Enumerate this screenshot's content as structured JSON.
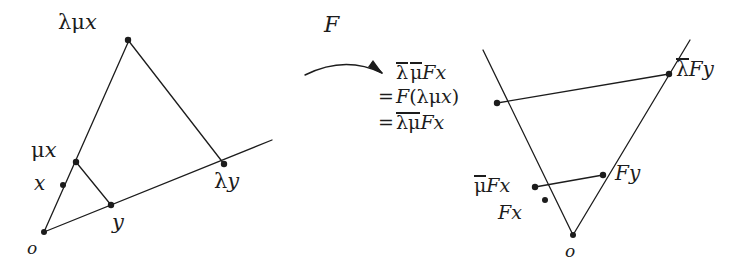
{
  "figure": {
    "background_color": "#ffffff",
    "ink_color": "#1c1c1c",
    "stroke_width": 1.3,
    "dot_radius": 3.0
  },
  "map_arrow": {
    "label": "F",
    "direction": "left-to-right",
    "shape": "curved-arc-with-arrowhead"
  },
  "left_figure": {
    "name": "source-triangle",
    "labels": {
      "apex": "λμx",
      "mid_left": "μx",
      "lower_left": "x",
      "origin": "o",
      "base_mid": "y",
      "base_right": "λy"
    },
    "points": [
      {
        "name": "o",
        "label": "o",
        "x": 44,
        "y": 232
      },
      {
        "name": "x",
        "label": "x",
        "x": 63,
        "y": 185
      },
      {
        "name": "mux",
        "label": "μx",
        "x": 76,
        "y": 162
      },
      {
        "name": "lmux",
        "label": "λμx",
        "x": 128,
        "y": 40
      },
      {
        "name": "y",
        "label": "y",
        "x": 111,
        "y": 205
      },
      {
        "name": "ly",
        "label": "λy",
        "x": 224,
        "y": 164
      }
    ],
    "segments": [
      {
        "from": "o",
        "to": "lmux",
        "note": "ray through x and mux to apex"
      },
      {
        "from": "o",
        "to": "ly",
        "note": "base ray through y, extended past ly"
      },
      {
        "from": "lmux",
        "to": "ly",
        "note": "outer side"
      },
      {
        "from": "mux",
        "to": "y",
        "note": "inner side"
      }
    ]
  },
  "right_figure": {
    "name": "image-triangle",
    "labels": {
      "apex_left_line1": "λ̄ μ̄Fx",
      "apex_left_line2": "= F(λμx)",
      "apex_left_line3": "= λμ̄Fx",
      "apex_right": "λ̄Fy",
      "mid_left": "μ̄Fx",
      "lower_left": "Fx",
      "mid_right": "Fy",
      "origin": "o"
    },
    "stack": [
      {
        "eq": "",
        "text": "λ̄ μ̄Fx"
      },
      {
        "eq": "=",
        "text": "F(λμx)"
      },
      {
        "eq": "=",
        "text": "λμ̄Fx"
      }
    ],
    "points": [
      {
        "name": "o",
        "label": "o",
        "x": 573,
        "y": 235
      },
      {
        "name": "Fx",
        "label": "Fx",
        "x": 545,
        "y": 200
      },
      {
        "name": "muFx",
        "label": "μ̄Fx",
        "x": 535,
        "y": 187
      },
      {
        "name": "lmuFx",
        "label": "λ̄ μ̄Fx",
        "x": 497,
        "y": 103
      },
      {
        "name": "Fy",
        "label": "Fy",
        "x": 603,
        "y": 175
      },
      {
        "name": "lFy",
        "label": "λ̄Fy",
        "x": 669,
        "y": 74
      }
    ],
    "segments": [
      {
        "from": "o",
        "to": "lmuFx",
        "note": "ray through Fx and muFx, extended past lmuFx"
      },
      {
        "from": "o",
        "to": "lFy",
        "note": "ray through Fy, extended past lFy"
      },
      {
        "from": "lmuFx",
        "to": "lFy",
        "note": "outer side"
      },
      {
        "from": "muFx",
        "to": "Fy",
        "note": "inner side"
      }
    ]
  }
}
